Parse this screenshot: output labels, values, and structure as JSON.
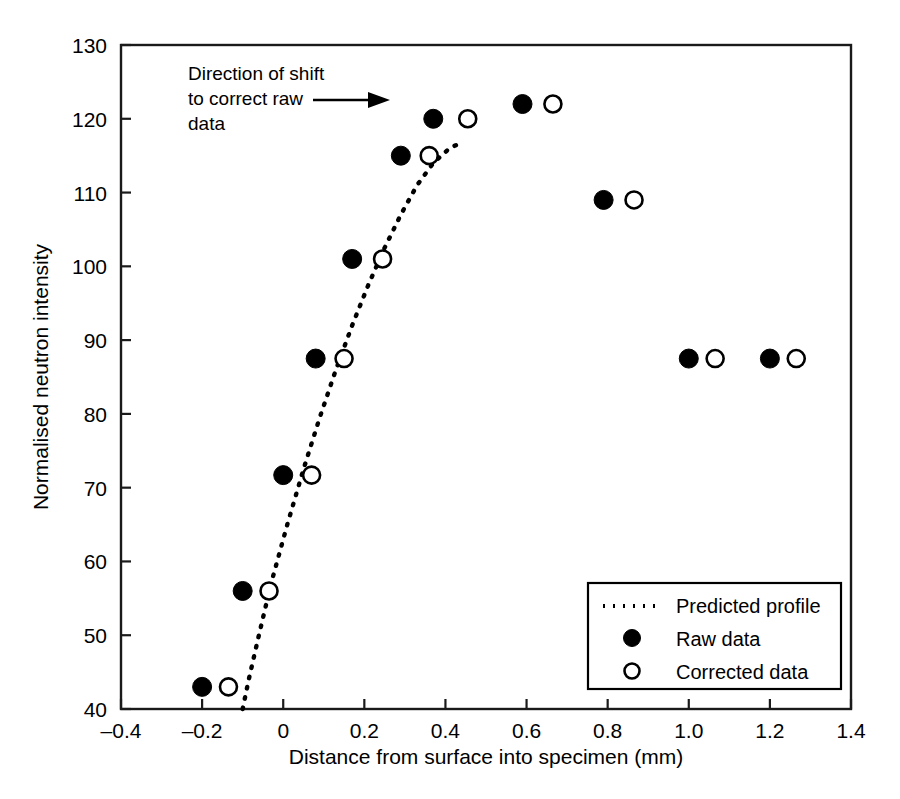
{
  "chart_data": {
    "type": "scatter",
    "title": "",
    "xlabel": "Distance from surface into specimen (mm)",
    "ylabel": "Normalised neutron intensity",
    "xlim": [
      -0.4,
      1.4
    ],
    "ylim": [
      40,
      130
    ],
    "xticks": [
      "-0.4",
      "-0.2",
      "0",
      "0.2",
      "0.4",
      "0.6",
      "0.8",
      "1.0",
      "1.2",
      "1.4"
    ],
    "xtick_values": [
      -0.4,
      -0.2,
      0,
      0.2,
      0.4,
      0.6,
      0.8,
      1.0,
      1.2,
      1.4
    ],
    "yticks": [
      "40",
      "50",
      "60",
      "70",
      "80",
      "90",
      "100",
      "110",
      "120",
      "130"
    ],
    "ytick_values": [
      40,
      50,
      60,
      70,
      80,
      90,
      100,
      110,
      120,
      130
    ],
    "grid": false,
    "legend_position": "lower-right",
    "series": [
      {
        "name": "Predicted profile",
        "type": "line",
        "style": "dotted",
        "marker": "none",
        "x": [
          -0.1,
          -0.085,
          -0.06,
          -0.03,
          0.01,
          0.05,
          0.09,
          0.13,
          0.17,
          0.21,
          0.25,
          0.29,
          0.33,
          0.37,
          0.41,
          0.44
        ],
        "y": [
          40.0,
          44.0,
          50.0,
          57.0,
          65.0,
          72.5,
          79.5,
          86.0,
          92.0,
          97.5,
          102.5,
          107.0,
          111.0,
          114.0,
          116.0,
          116.8
        ]
      },
      {
        "name": "Raw data",
        "type": "scatter",
        "marker": "filled-circle",
        "x": [
          -0.2,
          -0.1,
          0.0,
          0.08,
          0.17,
          0.29,
          0.37,
          0.59,
          0.79,
          1.0,
          1.2
        ],
        "y": [
          43.0,
          56.0,
          71.7,
          87.5,
          101.0,
          115.0,
          120.0,
          122.0,
          109.0,
          87.5,
          87.5
        ]
      },
      {
        "name": "Corrected data",
        "type": "scatter",
        "marker": "open-circle",
        "x": [
          -0.135,
          -0.035,
          0.07,
          0.15,
          0.245,
          0.36,
          0.455,
          0.665,
          0.865,
          1.065,
          1.265
        ],
        "y": [
          43.0,
          56.0,
          71.7,
          87.5,
          101.0,
          115.0,
          120.0,
          122.0,
          109.0,
          87.5,
          87.5
        ]
      }
    ],
    "annotations": [
      {
        "name": "direction-of-shift",
        "lines": [
          "Direction of shift",
          "to correct raw",
          "data"
        ],
        "arrow": "right-arrow",
        "x": -0.14,
        "y": 125.0
      }
    ]
  },
  "legend": {
    "entries": [
      {
        "label": "Predicted profile",
        "marker": "dotted-line"
      },
      {
        "label": "Raw data",
        "marker": "filled-circle"
      },
      {
        "label": "Corrected data",
        "marker": "open-circle"
      }
    ]
  },
  "colors": {
    "foreground": "#000000",
    "axis": "#1a1a1a",
    "background": "#ffffff"
  }
}
